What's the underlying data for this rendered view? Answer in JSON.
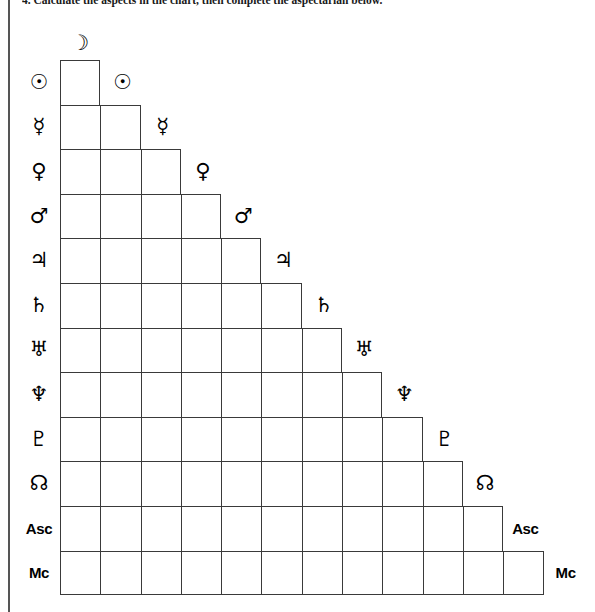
{
  "instruction": {
    "text": "4. Calculate the aspects in the chart, then complete the aspectarian below."
  },
  "colors": {
    "grid_line": "#3a3a3a",
    "page_rule": "#555555",
    "background": "#ffffff",
    "ink": "#000000"
  },
  "aspectarian": {
    "title": "Aspectarian grid",
    "row_labels": [
      {
        "name": "sun",
        "glyph": "☉",
        "label": "Sun",
        "type": "glyph"
      },
      {
        "name": "mercury",
        "glyph": "☿",
        "label": "Mercury",
        "type": "glyph"
      },
      {
        "name": "venus",
        "glyph": "♀",
        "label": "Venus",
        "type": "glyph"
      },
      {
        "name": "mars",
        "glyph": "♂",
        "label": "Mars",
        "type": "glyph"
      },
      {
        "name": "jupiter",
        "glyph": "♃",
        "label": "Jupiter",
        "type": "glyph"
      },
      {
        "name": "saturn",
        "glyph": "♄",
        "label": "Saturn",
        "type": "glyph"
      },
      {
        "name": "uranus",
        "glyph": "♅",
        "label": "Uranus",
        "type": "glyph"
      },
      {
        "name": "neptune",
        "glyph": "♆",
        "label": "Neptune",
        "type": "glyph"
      },
      {
        "name": "pluto",
        "glyph": "♇",
        "label": "Pluto",
        "type": "glyph"
      },
      {
        "name": "north-node",
        "glyph": "☊",
        "label": "North Node",
        "type": "glyph"
      },
      {
        "name": "ascendant",
        "glyph": "Asc",
        "label": "Ascendant",
        "type": "text"
      },
      {
        "name": "midheaven",
        "glyph": "Mc",
        "label": "Midheaven",
        "type": "text"
      }
    ],
    "diagonal_labels": [
      {
        "name": "moon",
        "glyph": "☽",
        "label": "Moon",
        "type": "glyph"
      },
      {
        "name": "sun",
        "glyph": "☉",
        "label": "Sun",
        "type": "glyph"
      },
      {
        "name": "mercury",
        "glyph": "☿",
        "label": "Mercury",
        "type": "glyph"
      },
      {
        "name": "venus",
        "glyph": "♀",
        "label": "Venus",
        "type": "glyph"
      },
      {
        "name": "mars",
        "glyph": "♂",
        "label": "Mars",
        "type": "glyph"
      },
      {
        "name": "jupiter",
        "glyph": "♃",
        "label": "Jupiter",
        "type": "glyph"
      },
      {
        "name": "saturn",
        "glyph": "♄",
        "label": "Saturn",
        "type": "glyph"
      },
      {
        "name": "uranus",
        "glyph": "♅",
        "label": "Uranus",
        "type": "glyph"
      },
      {
        "name": "neptune",
        "glyph": "♆",
        "label": "Neptune",
        "type": "glyph"
      },
      {
        "name": "pluto",
        "glyph": "♇",
        "label": "Pluto",
        "type": "glyph"
      },
      {
        "name": "north-node",
        "glyph": "☊",
        "label": "North Node",
        "type": "glyph"
      },
      {
        "name": "ascendant",
        "glyph": "Asc",
        "label": "Ascendant",
        "type": "text"
      },
      {
        "name": "midheaven",
        "glyph": "Mc",
        "label": "Midheaven",
        "type": "text"
      }
    ],
    "row_cell_counts": [
      1,
      2,
      3,
      4,
      5,
      6,
      7,
      8,
      9,
      10,
      11,
      12
    ],
    "cells": [
      [
        ""
      ],
      [
        "",
        ""
      ],
      [
        "",
        "",
        ""
      ],
      [
        "",
        "",
        "",
        ""
      ],
      [
        "",
        "",
        "",
        "",
        ""
      ],
      [
        "",
        "",
        "",
        "",
        "",
        ""
      ],
      [
        "",
        "",
        "",
        "",
        "",
        "",
        ""
      ],
      [
        "",
        "",
        "",
        "",
        "",
        "",
        "",
        ""
      ],
      [
        "",
        "",
        "",
        "",
        "",
        "",
        "",
        "",
        ""
      ],
      [
        "",
        "",
        "",
        "",
        "",
        "",
        "",
        "",
        "",
        ""
      ],
      [
        "",
        "",
        "",
        "",
        "",
        "",
        "",
        "",
        "",
        "",
        ""
      ],
      [
        "",
        "",
        "",
        "",
        "",
        "",
        "",
        "",
        "",
        "",
        "",
        ""
      ]
    ]
  }
}
